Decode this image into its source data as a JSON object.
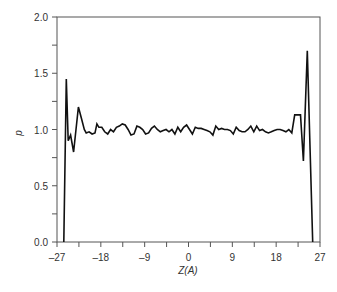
{
  "chart_data": {
    "type": "line",
    "title": "",
    "xlabel": "Z(A)",
    "ylabel": "p",
    "xlim": [
      -27,
      27
    ],
    "ylim": [
      0.0,
      2.0
    ],
    "x_ticks": [
      -27,
      -18,
      -9,
      0,
      9,
      18,
      27
    ],
    "x_tick_labels": [
      "-27",
      "-18",
      "-9",
      "0",
      "9",
      "18",
      "27"
    ],
    "x_minor_step": 4.5,
    "y_ticks": [
      0.0,
      0.5,
      1.0,
      1.5,
      2.0
    ],
    "y_tick_labels": [
      "0.0",
      "0.5",
      "1.0",
      "1.5",
      "2.0"
    ],
    "y_minor_step": 0.25,
    "grid": false,
    "legend": null,
    "series": [
      {
        "name": "density",
        "color": "#111111",
        "x": [
          -25.6,
          -25.1,
          -24.7,
          -24.2,
          -23.6,
          -22.6,
          -22.0,
          -21.4,
          -21.0,
          -20.4,
          -19.8,
          -19.2,
          -18.8,
          -18.4,
          -17.8,
          -17.2,
          -16.6,
          -16.0,
          -15.4,
          -14.8,
          -14.2,
          -13.6,
          -13.0,
          -12.4,
          -11.8,
          -11.2,
          -10.6,
          -10.0,
          -9.4,
          -8.8,
          -8.2,
          -7.6,
          -7.0,
          -6.4,
          -5.8,
          -5.2,
          -4.6,
          -4.0,
          -3.4,
          -2.8,
          -2.2,
          -1.6,
          -1.0,
          -0.4,
          0.2,
          0.8,
          1.4,
          2.0,
          2.6,
          3.2,
          3.8,
          4.4,
          5.0,
          5.6,
          6.2,
          6.8,
          7.4,
          8.0,
          8.6,
          9.2,
          9.8,
          10.4,
          11.0,
          11.6,
          12.2,
          12.8,
          13.4,
          14.0,
          14.6,
          15.2,
          15.8,
          16.4,
          17.0,
          17.6,
          18.2,
          18.8,
          19.4,
          20.0,
          20.6,
          21.2,
          21.8,
          22.2,
          23.0,
          23.6,
          24.4,
          25.5
        ],
        "y": [
          0.0,
          1.45,
          0.9,
          0.95,
          0.8,
          1.2,
          1.1,
          1.0,
          0.97,
          0.98,
          0.96,
          0.97,
          1.05,
          1.02,
          1.02,
          0.98,
          0.96,
          1.0,
          0.98,
          1.02,
          1.03,
          1.05,
          1.04,
          1.0,
          0.95,
          0.96,
          1.03,
          1.02,
          1.0,
          0.96,
          0.97,
          1.01,
          1.03,
          1.0,
          0.98,
          0.99,
          1.0,
          0.98,
          1.0,
          0.96,
          1.02,
          0.98,
          1.02,
          1.04,
          1.0,
          0.96,
          1.02,
          1.01,
          1.01,
          1.0,
          0.99,
          0.98,
          0.95,
          1.03,
          1.0,
          1.01,
          1.0,
          1.0,
          0.99,
          0.96,
          1.02,
          0.99,
          0.98,
          0.98,
          1.0,
          1.03,
          0.98,
          1.03,
          0.99,
          1.0,
          0.98,
          0.97,
          0.98,
          0.99,
          1.0,
          1.0,
          0.99,
          0.98,
          1.0,
          0.97,
          1.13,
          1.13,
          1.13,
          0.72,
          1.7,
          0.0
        ]
      }
    ]
  },
  "axes": {
    "xlabel": "Z(A)",
    "ylabel": "p"
  }
}
